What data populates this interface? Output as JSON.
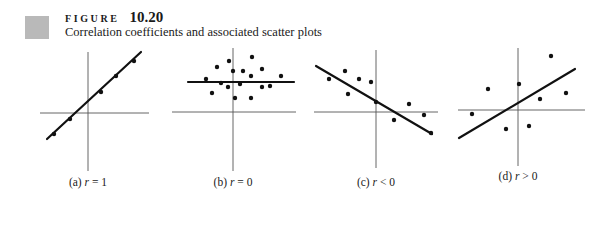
{
  "figure": {
    "label_word": "FIGURE",
    "number": "10.20",
    "caption": "Correlation coefficients and associated scatter plots",
    "marker_color": "#b9b9b9"
  },
  "chart_data": [
    {
      "type": "scatter",
      "title": "(a) r = 1",
      "panel": "a",
      "label_prefix": "(a)",
      "label_var": "r",
      "label_rel": "= 1",
      "points": [
        [
          -34,
          -21
        ],
        [
          -18,
          -6
        ],
        [
          13,
          21
        ],
        [
          28,
          37
        ],
        [
          46,
          52
        ]
      ],
      "fit_line": {
        "from": [
          -41,
          -26
        ],
        "to": [
          53,
          61
        ]
      },
      "note": "All points lie exactly on an upward-sloping line"
    },
    {
      "type": "scatter",
      "title": "(b) r = 0",
      "panel": "b",
      "label_prefix": "(b)",
      "label_var": "r",
      "label_rel": "= 0",
      "points": [
        [
          -4,
          51
        ],
        [
          19,
          55
        ],
        [
          -16,
          45
        ],
        [
          0,
          41
        ],
        [
          10,
          41
        ],
        [
          29,
          43
        ],
        [
          -27,
          33
        ],
        [
          18,
          36
        ],
        [
          48,
          36
        ],
        [
          -12,
          29
        ],
        [
          -5,
          25
        ],
        [
          7,
          28
        ],
        [
          29,
          25
        ],
        [
          37,
          26
        ],
        [
          -21,
          19
        ],
        [
          2,
          14
        ],
        [
          18,
          14
        ]
      ],
      "fit_line": {
        "from": [
          -45,
          30
        ],
        "to": [
          61,
          30
        ]
      },
      "note": "Horizontal fit line; no linear relationship"
    },
    {
      "type": "scatter",
      "title": "(c) r < 0",
      "panel": "c",
      "label_prefix": "(c)",
      "label_var": "r",
      "label_rel": "< 0",
      "points": [
        [
          -47,
          33
        ],
        [
          -31,
          41
        ],
        [
          -28,
          18
        ],
        [
          -17,
          33
        ],
        [
          -5,
          30
        ],
        [
          0,
          10
        ],
        [
          33,
          8
        ],
        [
          18,
          -8
        ],
        [
          48,
          -3
        ],
        [
          55,
          -21
        ]
      ],
      "fit_line": {
        "from": [
          -60,
          46
        ],
        "to": [
          56,
          -22
        ]
      },
      "note": "Downward-sloping fit line"
    },
    {
      "type": "scatter",
      "title": "(d) r > 0",
      "panel": "d",
      "label_prefix": "(d)",
      "label_var": "r",
      "label_rel": "> 0",
      "points": [
        [
          33,
          54
        ],
        [
          -30,
          21
        ],
        [
          1,
          26
        ],
        [
          22,
          11
        ],
        [
          48,
          17
        ],
        [
          -46,
          -4
        ],
        [
          -12,
          -19
        ],
        [
          11,
          -16
        ]
      ],
      "fit_line": {
        "from": [
          -59,
          -28
        ],
        "to": [
          57,
          41
        ]
      },
      "note": "Upward-sloping fit line with scattered points"
    }
  ],
  "layout": {
    "panels": [
      {
        "cx": 88,
        "cy": 113,
        "h_axis": [
          40,
          149
        ],
        "v_axis": [
          52,
          171
        ],
        "label_y": 176
      },
      {
        "cx": 233,
        "cy": 112,
        "h_axis": [
          172,
          296
        ],
        "v_axis": [
          48,
          171
        ],
        "label_y": 176
      },
      {
        "cx": 376,
        "cy": 112,
        "h_axis": [
          314,
          438
        ],
        "v_axis": [
          50,
          168
        ],
        "label_y": 176
      },
      {
        "cx": 518,
        "cy": 110,
        "h_axis": [
          458,
          585
        ],
        "v_axis": [
          48,
          166
        ],
        "label_y": 170
      }
    ]
  }
}
